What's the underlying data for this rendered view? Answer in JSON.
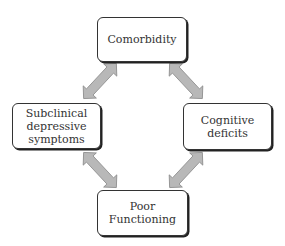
{
  "diagram": {
    "nodes": [
      {
        "id": "comorbidity",
        "label": "Comorbidity"
      },
      {
        "id": "subclinical",
        "label": "Subclinical depressive symptoms"
      },
      {
        "id": "cognitive",
        "label": "Cognitive deficits"
      },
      {
        "id": "functioning",
        "label": "Poor Functioning"
      }
    ],
    "edges": [
      {
        "from": "comorbidity",
        "to": "subclinical",
        "type": "bidirectional"
      },
      {
        "from": "comorbidity",
        "to": "cognitive",
        "type": "bidirectional"
      },
      {
        "from": "subclinical",
        "to": "functioning",
        "type": "bidirectional"
      },
      {
        "from": "cognitive",
        "to": "functioning",
        "type": "bidirectional"
      }
    ],
    "colors": {
      "arrow_fill": "#b8b8b8",
      "arrow_stroke": "#888888",
      "box_border": "#333333"
    }
  }
}
